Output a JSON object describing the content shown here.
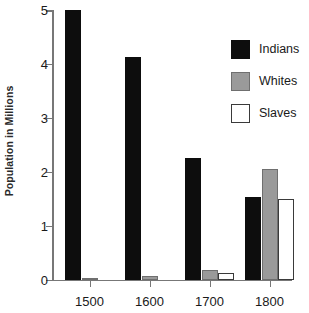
{
  "chart_data": {
    "type": "bar",
    "title": "",
    "xlabel": "",
    "ylabel": "Population in Millions",
    "categories": [
      "1500",
      "1600",
      "1700",
      "1800"
    ],
    "ylim": [
      0,
      5
    ],
    "yticks": [
      0,
      1,
      2,
      3,
      4,
      5
    ],
    "ytick_labels": [
      "0",
      "1",
      "2",
      "3",
      "4",
      "5"
    ],
    "grid": false,
    "legend_position": "top-right",
    "series": [
      {
        "name": "Indians",
        "color": "#0d0d0d",
        "values": [
          5.0,
          4.12,
          2.25,
          1.53
        ]
      },
      {
        "name": "Whites",
        "color": "#9a9a9a",
        "values": [
          0.03,
          0.06,
          0.18,
          2.05
        ]
      },
      {
        "name": "Slaves",
        "color": "#ffffff",
        "values": [
          0.0,
          0.0,
          0.12,
          1.49
        ]
      }
    ]
  },
  "legend": {
    "items": [
      {
        "label": "Indians",
        "swatch": "legend-swatch-indians"
      },
      {
        "label": "Whites",
        "swatch": "legend-swatch-whites"
      },
      {
        "label": "Slaves",
        "swatch": "legend-swatch-slaves"
      }
    ]
  },
  "colors": {
    "indians": "#0d0d0d",
    "whites": "#9a9a9a",
    "slaves": "#ffffff",
    "axis": "#777777",
    "text": "#1a1a1a",
    "background": "#ffffff"
  }
}
